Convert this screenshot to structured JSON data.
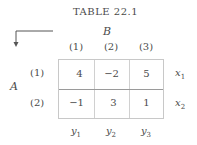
{
  "title": "TABLE 22.1",
  "column_player": "B",
  "row_player": "A",
  "column_headers": [
    "(1)",
    "(2)",
    "(3)"
  ],
  "row_headers": [
    "(1)",
    "(2)"
  ],
  "cells": [
    [
      "4",
      "−2",
      "5"
    ],
    [
      "−1",
      "3",
      "1"
    ]
  ],
  "row_vars": [
    {
      "base": "x",
      "sub": "1"
    },
    {
      "base": "x",
      "sub": "2"
    }
  ],
  "col_vars": [
    {
      "base": "y",
      "sub": "1"
    },
    {
      "base": "y",
      "sub": "2"
    },
    {
      "base": "y",
      "sub": "3"
    }
  ]
}
